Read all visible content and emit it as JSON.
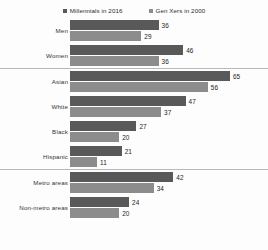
{
  "legend": {
    "position": "top-center",
    "entries": [
      {
        "label": "Millennials in 2016",
        "color": "#595959",
        "marker": "square-marker"
      },
      {
        "label": "Gen Xers in 2000",
        "color": "#8c8c8c",
        "marker": "square-marker"
      }
    ]
  },
  "chart_data": {
    "type": "bar",
    "orientation": "horizontal",
    "title": "",
    "subtitle": "",
    "xlabel": "",
    "ylabel": "",
    "xlim": [
      0,
      65
    ],
    "grid": false,
    "legend_position": "top-center",
    "categories": [
      "Men",
      "Women",
      "Asian",
      "White",
      "Black",
      "Hispanic",
      "Metro areas",
      "Non-metro areas"
    ],
    "series": [
      {
        "name": "Millennials in 2016",
        "color": "#595959",
        "values": [
          36,
          46,
          65,
          47,
          27,
          21,
          42,
          24
        ]
      },
      {
        "name": "Gen Xers in 2000",
        "color": "#8c8c8c",
        "values": [
          29,
          36,
          56,
          37,
          20,
          11,
          34,
          20
        ]
      }
    ],
    "sections": [
      {
        "name": "gender",
        "categories": [
          "Men",
          "Women"
        ]
      },
      {
        "name": "race-ethnicity",
        "categories": [
          "Asian",
          "White",
          "Black",
          "Hispanic"
        ]
      },
      {
        "name": "geography",
        "categories": [
          "Metro areas",
          "Non-metro areas"
        ]
      }
    ]
  },
  "scale": {
    "px_per_unit": 2.46,
    "max_value": 65
  },
  "colors": {
    "series_a": "#595959",
    "series_b": "#8c8c8c",
    "separator": "#b9b9b9",
    "text": "#333333",
    "background": "#fdfdfd"
  }
}
